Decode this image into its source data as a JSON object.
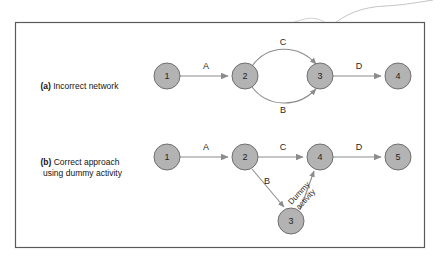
{
  "figure": {
    "frame": {
      "x": 15,
      "y": 22,
      "width": 410,
      "height": 226,
      "border_color": "#5a5a5a",
      "fill": "#ffffff"
    },
    "decoration": {
      "name": "swoosh-curve",
      "color": "#b9b9b9"
    },
    "palette": {
      "node_fill": "#b3b3b3",
      "node_stroke": "#6f6f6f",
      "edge_color": "#8c8c8c",
      "text_color": "#1a1a1a",
      "background": "#ffffff"
    },
    "panels": [
      {
        "id": "a",
        "caption_tag": "(a)",
        "caption_lines": [
          "Incorrect network"
        ],
        "nodes": [
          {
            "id": "a1",
            "label": "1",
            "cx": 167,
            "cy": 76,
            "r": 13
          },
          {
            "id": "a2",
            "label": "2",
            "cx": 245,
            "cy": 76,
            "r": 13
          },
          {
            "id": "a3",
            "label": "3",
            "cx": 320,
            "cy": 76,
            "r": 13
          },
          {
            "id": "a4",
            "label": "4",
            "cx": 398,
            "cy": 76,
            "r": 13
          }
        ],
        "edges": [
          {
            "id": "a-A",
            "label": "A",
            "from": "1",
            "to": "2",
            "style": "straight",
            "label_x": 206,
            "label_y": 66
          },
          {
            "id": "a-C",
            "label": "C",
            "from": "2",
            "to": "3",
            "style": "curved-up",
            "label_x": 283,
            "label_y": 42
          },
          {
            "id": "a-B",
            "label": "B",
            "from": "2",
            "to": "3",
            "style": "curved-down",
            "label_x": 283,
            "label_y": 110
          },
          {
            "id": "a-D",
            "label": "D",
            "from": "3",
            "to": "4",
            "style": "straight",
            "label_x": 359,
            "label_y": 66
          }
        ]
      },
      {
        "id": "b",
        "caption_tag": "(b)",
        "caption_lines": [
          "Correct approach",
          "using dummy activity"
        ],
        "nodes": [
          {
            "id": "b1",
            "label": "1",
            "cx": 167,
            "cy": 157,
            "r": 13
          },
          {
            "id": "b2",
            "label": "2",
            "cx": 245,
            "cy": 157,
            "r": 13
          },
          {
            "id": "b4",
            "label": "4",
            "cx": 320,
            "cy": 157,
            "r": 13
          },
          {
            "id": "b5",
            "label": "5",
            "cx": 398,
            "cy": 157,
            "r": 13
          },
          {
            "id": "b3",
            "label": "3",
            "cx": 291,
            "cy": 221,
            "r": 13
          }
        ],
        "edges": [
          {
            "id": "b-A",
            "label": "A",
            "from": "1",
            "to": "2",
            "style": "straight",
            "label_x": 206,
            "label_y": 147
          },
          {
            "id": "b-C",
            "label": "C",
            "from": "2",
            "to": "4",
            "style": "straight",
            "label_x": 283,
            "label_y": 147
          },
          {
            "id": "b-D",
            "label": "D",
            "from": "4",
            "to": "5",
            "style": "straight",
            "label_x": 359,
            "label_y": 147
          },
          {
            "id": "b-B",
            "label": "B",
            "from": "2",
            "to": "3",
            "style": "diagonal",
            "label_x": 267,
            "label_y": 181
          },
          {
            "id": "b-dummy",
            "label": "Dummy activity",
            "from": "3",
            "to": "4",
            "style": "diagonal-dashed-label",
            "rotation": -45
          }
        ],
        "dummy_label_lines": [
          "Dummy",
          "activity"
        ]
      }
    ]
  }
}
